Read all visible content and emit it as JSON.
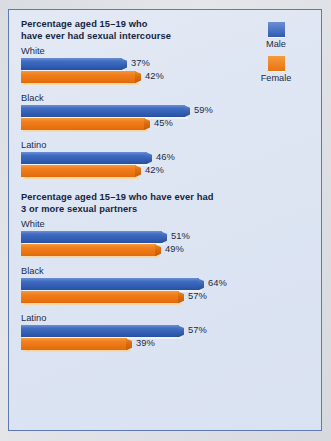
{
  "figure": {
    "legend": {
      "items": [
        {
          "label": "Male",
          "color": "#3f6cc0",
          "key": "male"
        },
        {
          "label": "Female",
          "color": "#f07f1e",
          "key": "female"
        }
      ]
    }
  },
  "chart_data": [
    {
      "type": "bar",
      "orientation": "horizontal",
      "title": "Percentage aged 15–19 who have ever had sexual intercourse",
      "categories": [
        "White",
        "Black",
        "Latino"
      ],
      "series": [
        {
          "name": "Male",
          "values": [
            37,
            59,
            46
          ],
          "labels": [
            "37%",
            "59%",
            "46%"
          ],
          "color": "#3f6cc0"
        },
        {
          "name": "Female",
          "values": [
            42,
            45,
            42
          ],
          "labels": [
            "42%",
            "45%",
            "42%"
          ],
          "color": "#f07f1e"
        }
      ],
      "xlabel": "",
      "ylabel": "",
      "xlim": [
        0,
        70
      ],
      "grid": false,
      "legend_position": "top-right"
    },
    {
      "type": "bar",
      "orientation": "horizontal",
      "title": "Percentage aged 15–19 who have ever had 3 or more sexual partners",
      "categories": [
        "White",
        "Black",
        "Latino"
      ],
      "series": [
        {
          "name": "Male",
          "values": [
            51,
            64,
            57
          ],
          "labels": [
            "51%",
            "64%",
            "57%"
          ],
          "color": "#3f6cc0"
        },
        {
          "name": "Female",
          "values": [
            49,
            57,
            39
          ],
          "labels": [
            "49%",
            "57%",
            "39%"
          ],
          "color": "#f07f1e"
        }
      ],
      "xlabel": "",
      "ylabel": "",
      "xlim": [
        0,
        70
      ],
      "grid": false,
      "legend_position": "top-right"
    }
  ],
  "titles": {
    "chart1_line1": "Percentage aged 15–19 who",
    "chart1_line2": "have ever had sexual intercourse",
    "chart2_line1": "Percentage aged 15–19 who have ever had",
    "chart2_line2": "3 or more sexual partners"
  }
}
